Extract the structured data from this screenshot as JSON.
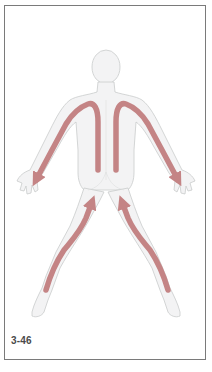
{
  "figure": {
    "label": "3-46",
    "view": "posterior",
    "colors": {
      "frame": "#7a7a7a",
      "body_fill": "#f3f3f4",
      "body_outline": "#c9cbcc",
      "arrow": "#c48485",
      "label": "#4a4a4a"
    },
    "arrows": [
      {
        "name": "left-back-arm-stroke",
        "direction": "down from spine over shoulder to left hand"
      },
      {
        "name": "right-back-arm-stroke",
        "direction": "down from spine over shoulder to right hand"
      },
      {
        "name": "left-leg-stroke",
        "direction": "up from left ankle to buttock"
      },
      {
        "name": "right-leg-stroke",
        "direction": "up from right ankle to buttock"
      }
    ]
  }
}
